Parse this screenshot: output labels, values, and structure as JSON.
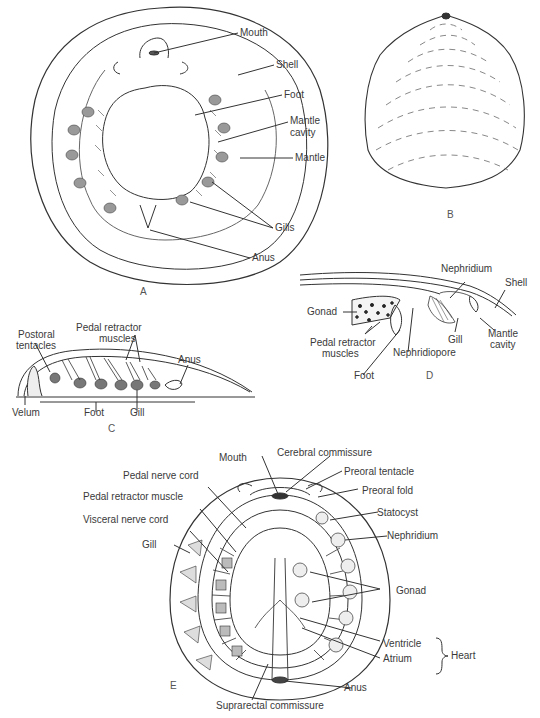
{
  "figure": {
    "panels": {
      "A": {
        "letter": "A",
        "labels": {
          "mouth": "Mouth",
          "shell": "Shell",
          "foot": "Foot",
          "mantle_cavity_1": "Mantle",
          "mantle_cavity_2": "cavity",
          "mantle": "Mantle",
          "gills": "Gills",
          "anus": "Anus"
        }
      },
      "B": {
        "letter": "B"
      },
      "C": {
        "letter": "C",
        "labels": {
          "postoral_tentacles_1": "Postoral",
          "postoral_tentacles_2": "tentacles",
          "pedal_retractor_1": "Pedal retractor",
          "pedal_retractor_2": "muscles",
          "anus": "Anus",
          "velum": "Velum",
          "foot": "Foot",
          "gill": "Gill"
        }
      },
      "D": {
        "letter": "D",
        "labels": {
          "nephridium": "Nephridium",
          "shell": "Shell",
          "gonad": "Gonad",
          "pedal_retractor_1": "Pedal retractor",
          "pedal_retractor_2": "muscles",
          "gill": "Gill",
          "mantle_cavity_1": "Mantle",
          "mantle_cavity_2": "cavity",
          "nephridiopore": "Nephridiopore",
          "foot": "Foot"
        }
      },
      "E": {
        "letter": "E",
        "labels": {
          "mouth": "Mouth",
          "cerebral_commissure": "Cerebral commissure",
          "preoral_tentacle": "Preoral tentacle",
          "preoral_fold": "Preoral fold",
          "statocyst": "Statocyst",
          "nephridium": "Nephridium",
          "pedal_nerve_cord": "Pedal nerve cord",
          "pedal_retractor_muscle": "Pedal retractor muscle",
          "visceral_nerve_cord": "Visceral nerve cord",
          "gill": "Gill",
          "gonad": "Gonad",
          "ventricle": "Ventricle",
          "atrium": "Atrium",
          "heart": "Heart",
          "anus": "Anus",
          "suprarectal_commissure": "Suprarectal commissure"
        }
      }
    }
  }
}
